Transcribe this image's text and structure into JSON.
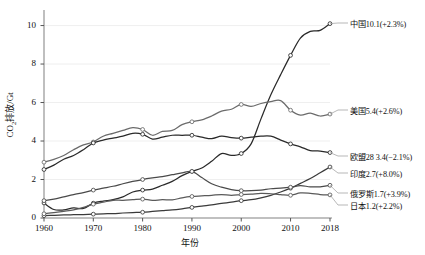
{
  "chart_data": {
    "type": "line",
    "title": "",
    "xlabel": "年份",
    "ylabel_html": "CO₂排放/Gt",
    "ylabel_main": "CO",
    "ylabel_sub": "2",
    "ylabel_tail": "排放/Gt",
    "xlim": [
      1960,
      2018
    ],
    "ylim": [
      0,
      10.6
    ],
    "grid": "horizontal",
    "legend_position": "right-end-labels",
    "xticks": [
      1960,
      1970,
      1980,
      1990,
      2000,
      2010,
      2018
    ],
    "xtick_labels": [
      "1960",
      "1970",
      "1980",
      "1990",
      "2000",
      "2010",
      "2018"
    ],
    "yticks": [
      0,
      2,
      4,
      6,
      8,
      10
    ],
    "ytick_labels": [
      "0",
      "2",
      "4",
      "6",
      "8",
      "10"
    ],
    "marker_years": [
      1960,
      1970,
      1980,
      1990,
      2000,
      2010,
      2018
    ],
    "series": [
      {
        "name": "中国",
        "label": "中国10.1(+2.3%)",
        "end_value": 10.1,
        "growth": "+2.3%",
        "color": "#2a2a2a",
        "x": [
          1960,
          1962,
          1964,
          1966,
          1968,
          1970,
          1972,
          1974,
          1976,
          1978,
          1980,
          1982,
          1984,
          1986,
          1988,
          1990,
          1992,
          1994,
          1996,
          1998,
          2000,
          2002,
          2004,
          2006,
          2008,
          2010,
          2012,
          2014,
          2016,
          2018
        ],
        "values": [
          0.78,
          0.44,
          0.42,
          0.52,
          0.5,
          0.77,
          0.88,
          0.95,
          1.1,
          1.35,
          1.45,
          1.5,
          1.7,
          1.9,
          2.2,
          2.42,
          2.6,
          2.95,
          3.35,
          3.25,
          3.35,
          3.85,
          5.15,
          6.4,
          7.45,
          8.45,
          9.35,
          9.7,
          9.75,
          10.1
        ]
      },
      {
        "name": "美国",
        "label": "美国5.4(+2.6%)",
        "end_value": 5.4,
        "growth": "+2.6%",
        "color": "#6b6b6b",
        "x": [
          1960,
          1962,
          1964,
          1966,
          1968,
          1970,
          1972,
          1974,
          1976,
          1978,
          1980,
          1982,
          1984,
          1986,
          1988,
          1990,
          1992,
          1994,
          1996,
          1998,
          2000,
          2002,
          2004,
          2006,
          2008,
          2010,
          2012,
          2014,
          2016,
          2018
        ],
        "values": [
          2.9,
          3.05,
          3.25,
          3.55,
          3.8,
          3.95,
          4.25,
          4.4,
          4.55,
          4.7,
          4.6,
          4.3,
          4.5,
          4.55,
          4.85,
          5.0,
          5.1,
          5.3,
          5.55,
          5.65,
          5.9,
          5.8,
          5.95,
          6.05,
          6.1,
          5.6,
          5.35,
          5.45,
          5.3,
          5.4
        ]
      },
      {
        "name": "欧盟28",
        "label": "欧盟28 3.4(−2.1%)",
        "end_value": 3.4,
        "growth": "−2.1%",
        "color": "#2a2a2a",
        "x": [
          1960,
          1962,
          1964,
          1966,
          1968,
          1970,
          1972,
          1974,
          1976,
          1978,
          1980,
          1982,
          1984,
          1986,
          1988,
          1990,
          1992,
          1994,
          1996,
          1998,
          2000,
          2002,
          2004,
          2006,
          2008,
          2010,
          2012,
          2014,
          2016,
          2018
        ],
        "values": [
          2.52,
          2.75,
          3.05,
          3.25,
          3.55,
          3.9,
          4.05,
          4.15,
          4.25,
          4.4,
          4.35,
          4.1,
          4.2,
          4.3,
          4.3,
          4.3,
          4.2,
          4.12,
          4.25,
          4.18,
          4.15,
          4.2,
          4.25,
          4.25,
          4.05,
          3.85,
          3.7,
          3.5,
          3.48,
          3.4
        ]
      },
      {
        "name": "印度",
        "label": "印度2.7(+8.0%)",
        "end_value": 2.7,
        "growth": "+8.0%",
        "color": "#3a3a3a",
        "x": [
          1960,
          1962,
          1964,
          1966,
          1968,
          1970,
          1972,
          1974,
          1976,
          1978,
          1980,
          1982,
          1984,
          1986,
          1988,
          1990,
          1992,
          1994,
          1996,
          1998,
          2000,
          2002,
          2004,
          2006,
          2008,
          2010,
          2012,
          2014,
          2016,
          2018
        ],
        "values": [
          0.12,
          0.14,
          0.16,
          0.17,
          0.18,
          0.2,
          0.22,
          0.23,
          0.26,
          0.28,
          0.3,
          0.34,
          0.38,
          0.42,
          0.48,
          0.55,
          0.62,
          0.68,
          0.76,
          0.82,
          0.9,
          0.95,
          1.05,
          1.18,
          1.35,
          1.55,
          1.8,
          2.05,
          2.35,
          2.65
        ]
      },
      {
        "name": "俄罗斯",
        "label": "俄罗斯1.7(+3.9%)",
        "end_value": 1.7,
        "growth": "+3.9%",
        "color": "#4a4a4a",
        "x": [
          1960,
          1962,
          1964,
          1966,
          1968,
          1970,
          1972,
          1974,
          1976,
          1978,
          1980,
          1982,
          1984,
          1986,
          1988,
          1990,
          1992,
          1994,
          1996,
          1998,
          2000,
          2002,
          2004,
          2006,
          2008,
          2010,
          2012,
          2014,
          2016,
          2018
        ],
        "values": [
          0.9,
          0.98,
          1.1,
          1.22,
          1.32,
          1.45,
          1.55,
          1.65,
          1.78,
          1.9,
          2.0,
          2.08,
          2.15,
          2.25,
          2.35,
          2.42,
          2.1,
          1.78,
          1.6,
          1.48,
          1.42,
          1.42,
          1.45,
          1.52,
          1.55,
          1.6,
          1.68,
          1.62,
          1.62,
          1.7
        ]
      },
      {
        "name": "日本",
        "label": "日本1.2(+2.2%)",
        "end_value": 1.2,
        "growth": "+2.2%",
        "color": "#5a5a5a",
        "x": [
          1960,
          1962,
          1964,
          1966,
          1968,
          1970,
          1972,
          1974,
          1976,
          1978,
          1980,
          1982,
          1984,
          1986,
          1988,
          1990,
          1992,
          1994,
          1996,
          1998,
          2000,
          2002,
          2004,
          2006,
          2008,
          2010,
          2012,
          2014,
          2016,
          2018
        ],
        "values": [
          0.22,
          0.28,
          0.35,
          0.42,
          0.55,
          0.72,
          0.82,
          0.92,
          0.92,
          0.95,
          0.98,
          0.92,
          0.95,
          0.94,
          1.05,
          1.12,
          1.15,
          1.18,
          1.22,
          1.18,
          1.22,
          1.24,
          1.28,
          1.26,
          1.22,
          1.18,
          1.3,
          1.28,
          1.22,
          1.2
        ]
      }
    ]
  }
}
